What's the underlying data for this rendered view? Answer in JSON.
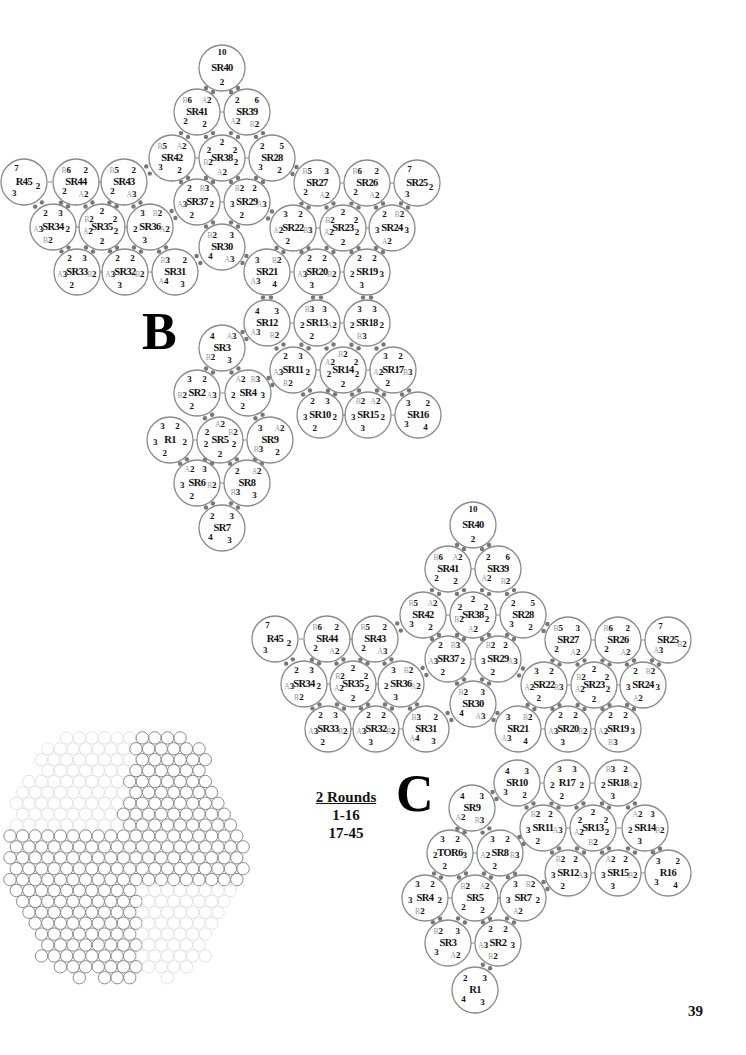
{
  "page": {
    "number": "39"
  },
  "sections": {
    "b": {
      "letter": "B"
    },
    "c": {
      "letter": "C"
    }
  },
  "rounds_note": {
    "title": "2 Rounds",
    "lines": [
      "1-16",
      "17-45"
    ]
  },
  "diagram_b": {
    "rings": [
      {
        "id": "SR40",
        "stitches": [
          "10",
          "2"
        ]
      },
      {
        "id": "SR41",
        "stitches": [
          "B6",
          "A2",
          "2",
          "2"
        ]
      },
      {
        "id": "SR39",
        "stitches": [
          "2",
          "6",
          "B2",
          "A2"
        ]
      },
      {
        "id": "SR42",
        "stitches": [
          "B5",
          "A2",
          "2",
          "3"
        ]
      },
      {
        "id": "SR38",
        "stitches": [
          "2",
          "2",
          "2",
          "B2",
          "2",
          "A2"
        ]
      },
      {
        "id": "SR28",
        "stitches": [
          "2",
          "5",
          "2",
          "3"
        ]
      },
      {
        "id": "R45",
        "stitches": [
          "7",
          "2",
          "3"
        ]
      },
      {
        "id": "SR44",
        "stitches": [
          "B6",
          "2",
          "A2",
          "2"
        ]
      },
      {
        "id": "SR43",
        "stitches": [
          "B5",
          "2",
          "A3",
          "2"
        ]
      },
      {
        "id": "SR37",
        "stitches": [
          "2",
          "B3",
          "2",
          "2",
          "A3"
        ]
      },
      {
        "id": "SR29",
        "stitches": [
          "B2",
          "2",
          "A3",
          "2",
          "3"
        ]
      },
      {
        "id": "SR27",
        "stitches": [
          "B5",
          "3",
          "A2",
          "2"
        ]
      },
      {
        "id": "SR26",
        "stitches": [
          "B6",
          "2",
          "A2",
          "2"
        ]
      },
      {
        "id": "SR25",
        "stitches": [
          "7",
          "2",
          "3"
        ]
      },
      {
        "id": "SR34",
        "stitches": [
          "2",
          "3",
          "2",
          "B2",
          "A3"
        ]
      },
      {
        "id": "SR35",
        "stitches": [
          "2",
          "B2",
          "2",
          "A2",
          "2",
          "2"
        ]
      },
      {
        "id": "SR36",
        "stitches": [
          "3",
          "B2",
          "A2",
          "3",
          "2"
        ]
      },
      {
        "id": "SR30",
        "stitches": [
          "B2",
          "3",
          "A3",
          "4"
        ]
      },
      {
        "id": "SR22",
        "stitches": [
          "3",
          "2",
          "B3",
          "2",
          "A2"
        ]
      },
      {
        "id": "SR23",
        "stitches": [
          "2",
          "B2",
          "2",
          "A2",
          "2",
          "2"
        ]
      },
      {
        "id": "SR24",
        "stitches": [
          "2",
          "B2",
          "3",
          "A2",
          "3"
        ]
      },
      {
        "id": "SR33",
        "stitches": [
          "2",
          "3",
          "B2",
          "2",
          "A3"
        ]
      },
      {
        "id": "SR32",
        "stitches": [
          "2",
          "2",
          "B2",
          "3",
          "A3"
        ]
      },
      {
        "id": "SR31",
        "stitches": [
          "B3",
          "2",
          "3",
          "A4"
        ]
      },
      {
        "id": "SR21",
        "stitches": [
          "3",
          "B2",
          "4",
          "A3"
        ]
      },
      {
        "id": "SR20",
        "stitches": [
          "2",
          "2",
          "B2",
          "3",
          "A3"
        ]
      },
      {
        "id": "SR19",
        "stitches": [
          "2",
          "2",
          "3",
          "3",
          "2"
        ]
      },
      {
        "id": "SR12",
        "stitches": [
          "4",
          "3",
          "B2",
          "A3"
        ]
      },
      {
        "id": "SR13",
        "stitches": [
          "B3",
          "3",
          "A2",
          "2",
          "2"
        ]
      },
      {
        "id": "SR18",
        "stitches": [
          "3",
          "3",
          "2",
          "B3",
          "2"
        ]
      },
      {
        "id": "SR3",
        "stitches": [
          "4",
          "A3",
          "3",
          "B2"
        ]
      },
      {
        "id": "SR11",
        "stitches": [
          "2",
          "3",
          "2",
          "B2",
          "A3"
        ]
      },
      {
        "id": "SR14",
        "stitches": [
          "B2",
          "A2",
          "2",
          "2",
          "2",
          "2"
        ]
      },
      {
        "id": "SR17",
        "stitches": [
          "3",
          "2",
          "B3",
          "2",
          "A2"
        ]
      },
      {
        "id": "SR2",
        "stitches": [
          "3",
          "2",
          "A3",
          "2",
          "B2"
        ]
      },
      {
        "id": "SR4",
        "stitches": [
          "A2",
          "B3",
          "3",
          "2",
          "2"
        ]
      },
      {
        "id": "SR10",
        "stitches": [
          "2",
          "3",
          "2",
          "2",
          "3"
        ]
      },
      {
        "id": "SR15",
        "stitches": [
          "B2",
          "A2",
          "2",
          "3",
          "3"
        ]
      },
      {
        "id": "SR16",
        "stitches": [
          "3",
          "2",
          "4",
          "3"
        ]
      },
      {
        "id": "R1",
        "stitches": [
          "3",
          "2",
          "2",
          "2",
          "3"
        ]
      },
      {
        "id": "SR5",
        "stitches": [
          "A2",
          "2",
          "B2",
          "2",
          "2",
          "2"
        ]
      },
      {
        "id": "SR9",
        "stitches": [
          "3",
          "A2",
          "2",
          "B3"
        ]
      },
      {
        "id": "SR6",
        "stitches": [
          "A2",
          "3",
          "B2",
          "2",
          "3"
        ]
      },
      {
        "id": "SR8",
        "stitches": [
          "2",
          "A2",
          "3",
          "B3"
        ]
      },
      {
        "id": "SR7",
        "stitches": [
          "2",
          "3",
          "3",
          "4"
        ]
      }
    ]
  },
  "diagram_c": {
    "rings": [
      {
        "id": "SR40",
        "stitches": [
          "10",
          "2"
        ]
      },
      {
        "id": "SR41",
        "stitches": [
          "B6",
          "A2",
          "2",
          "2"
        ]
      },
      {
        "id": "SR39",
        "stitches": [
          "2",
          "6",
          "B2",
          "A2"
        ]
      },
      {
        "id": "SR42",
        "stitches": [
          "B5",
          "A2",
          "2",
          "3"
        ]
      },
      {
        "id": "SR38",
        "stitches": [
          "2",
          "2",
          "2",
          "B2",
          "2",
          "A2"
        ]
      },
      {
        "id": "SR28",
        "stitches": [
          "2",
          "5",
          "2",
          "3"
        ]
      },
      {
        "id": "R45",
        "stitches": [
          "7",
          "2",
          "3"
        ]
      },
      {
        "id": "SR44",
        "stitches": [
          "B6",
          "2",
          "A2",
          "2"
        ]
      },
      {
        "id": "SR43",
        "stitches": [
          "B5",
          "2",
          "A3",
          "2"
        ]
      },
      {
        "id": "SR37",
        "stitches": [
          "2",
          "B3",
          "2",
          "2",
          "A3"
        ]
      },
      {
        "id": "SR29",
        "stitches": [
          "B2",
          "2",
          "A3",
          "2",
          "3"
        ]
      },
      {
        "id": "SR27",
        "stitches": [
          "B5",
          "3",
          "A2",
          "2"
        ]
      },
      {
        "id": "SR26",
        "stitches": [
          "B6",
          "2",
          "A2",
          "2"
        ]
      },
      {
        "id": "SR25",
        "stitches": [
          "7",
          "B2",
          "A3"
        ]
      },
      {
        "id": "SR34",
        "stitches": [
          "2",
          "3",
          "2",
          "B2",
          "A3"
        ]
      },
      {
        "id": "SR35",
        "stitches": [
          "2",
          "B2",
          "2",
          "A2",
          "2",
          "2"
        ]
      },
      {
        "id": "SR36",
        "stitches": [
          "3",
          "B2",
          "A2",
          "3",
          "2"
        ]
      },
      {
        "id": "SR30",
        "stitches": [
          "B2",
          "3",
          "A3",
          "4"
        ]
      },
      {
        "id": "SR22",
        "stitches": [
          "3",
          "2",
          "B3",
          "2",
          "A2"
        ]
      },
      {
        "id": "SR23",
        "stitches": [
          "2",
          "B2",
          "2",
          "A2",
          "2",
          "2"
        ]
      },
      {
        "id": "SR24",
        "stitches": [
          "2",
          "B2",
          "3",
          "A2",
          "3"
        ]
      },
      {
        "id": "SR33",
        "stitches": [
          "2",
          "3",
          "B2",
          "2",
          "A3"
        ]
      },
      {
        "id": "SR32",
        "stitches": [
          "2",
          "2",
          "B2",
          "3",
          "A3"
        ]
      },
      {
        "id": "SR31",
        "stitches": [
          "B3",
          "2",
          "3",
          "A4"
        ]
      },
      {
        "id": "SR21",
        "stitches": [
          "3",
          "B2",
          "4",
          "A3"
        ]
      },
      {
        "id": "SR20",
        "stitches": [
          "2",
          "2",
          "B2",
          "3",
          "A3"
        ]
      },
      {
        "id": "SR19",
        "stitches": [
          "2",
          "2",
          "3",
          "B3",
          "A2"
        ]
      },
      {
        "id": "SR10",
        "stitches": [
          "4",
          "3",
          "2",
          "3"
        ]
      },
      {
        "id": "R17",
        "stitches": [
          "3",
          "3",
          "2",
          "2",
          "2"
        ]
      },
      {
        "id": "SR18",
        "stitches": [
          "B3",
          "2",
          "A2",
          "3",
          "2"
        ]
      },
      {
        "id": "SR9",
        "stitches": [
          "4",
          "3",
          "B3",
          "A2"
        ]
      },
      {
        "id": "SR11",
        "stitches": [
          "B2",
          "2",
          "A3",
          "2",
          "3"
        ]
      },
      {
        "id": "SR13",
        "stitches": [
          "2",
          "2",
          "2",
          "A2",
          "2",
          "B2"
        ]
      },
      {
        "id": "SR14",
        "stitches": [
          "A2",
          "3",
          "B2",
          "3",
          "2"
        ]
      },
      {
        "id": "TOR6",
        "stitches": [
          "3",
          "2",
          "3",
          "2",
          "2"
        ]
      },
      {
        "id": "SR8",
        "stitches": [
          "3",
          "2",
          "B3",
          "2",
          "A2"
        ]
      },
      {
        "id": "SR12",
        "stitches": [
          "B2",
          "2",
          "A3",
          "2",
          "3"
        ]
      },
      {
        "id": "SR15",
        "stitches": [
          "A2",
          "2",
          "B2",
          "3",
          "3"
        ]
      },
      {
        "id": "R16",
        "stitches": [
          "3",
          "2",
          "4",
          "3"
        ]
      },
      {
        "id": "SR4",
        "stitches": [
          "3",
          "2",
          "2",
          "B2",
          "3"
        ]
      },
      {
        "id": "SR5",
        "stitches": [
          "B2",
          "A2",
          "2",
          "2"
        ]
      },
      {
        "id": "SR7",
        "stitches": [
          "3",
          "B2",
          "2",
          "A2",
          "3"
        ]
      },
      {
        "id": "SR3",
        "stitches": [
          "B2",
          "3",
          "A2",
          "3"
        ]
      },
      {
        "id": "SR2",
        "stitches": [
          "2",
          "2",
          "3",
          "B2",
          "A3"
        ]
      },
      {
        "id": "R1",
        "stitches": [
          "2",
          "3",
          "3",
          "4"
        ]
      }
    ]
  }
}
